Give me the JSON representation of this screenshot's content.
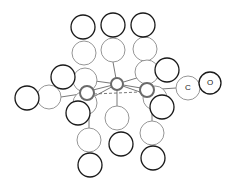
{
  "diagram": {
    "title": "",
    "type": "molecular-structure",
    "labels": {
      "carbon": "C",
      "oxygen": "O"
    },
    "colors": {
      "oxygen_stroke": "#1a1a1a",
      "carbon_stroke": "#8a8a8a",
      "metal_stroke": "#6a6a6a",
      "bond": "#555555"
    },
    "atoms": {
      "metals": [
        {
          "id": "M1",
          "cx": 117,
          "cy": 84,
          "r": 6
        },
        {
          "id": "M2",
          "cx": 87,
          "cy": 93,
          "r": 7
        },
        {
          "id": "M3",
          "cx": 147,
          "cy": 90,
          "r": 7
        }
      ],
      "carbons": [
        {
          "cx": 84,
          "cy": 53,
          "r": 12
        },
        {
          "cx": 113,
          "cy": 50,
          "r": 12
        },
        {
          "cx": 145,
          "cy": 49,
          "r": 12
        },
        {
          "cx": 85,
          "cy": 80,
          "r": 12
        },
        {
          "cx": 147,
          "cy": 72,
          "r": 12
        },
        {
          "cx": 49,
          "cy": 97,
          "r": 12
        },
        {
          "cx": 188,
          "cy": 88,
          "r": 12
        },
        {
          "cx": 85,
          "cy": 103,
          "r": 12
        },
        {
          "cx": 155,
          "cy": 98,
          "r": 12
        },
        {
          "cx": 117,
          "cy": 118,
          "r": 12
        },
        {
          "cx": 89,
          "cy": 140,
          "r": 12
        },
        {
          "cx": 152,
          "cy": 133,
          "r": 12
        }
      ],
      "oxygens": [
        {
          "cx": 83,
          "cy": 27,
          "r": 12
        },
        {
          "cx": 113,
          "cy": 25,
          "r": 12
        },
        {
          "cx": 143,
          "cy": 25,
          "r": 12
        },
        {
          "cx": 63,
          "cy": 77,
          "r": 12
        },
        {
          "cx": 167,
          "cy": 70,
          "r": 12
        },
        {
          "cx": 27,
          "cy": 98,
          "r": 12
        },
        {
          "cx": 210,
          "cy": 83,
          "r": 11
        },
        {
          "cx": 78,
          "cy": 113,
          "r": 12
        },
        {
          "cx": 162,
          "cy": 107,
          "r": 12
        },
        {
          "cx": 121,
          "cy": 144,
          "r": 12
        },
        {
          "cx": 90,
          "cy": 165,
          "r": 12
        },
        {
          "cx": 153,
          "cy": 158,
          "r": 12
        }
      ]
    }
  }
}
